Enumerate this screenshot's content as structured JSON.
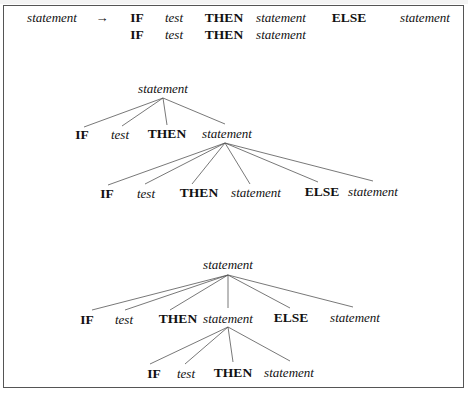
{
  "figure": {
    "grammar_rule": {
      "lhs": "statement",
      "arrow": "→",
      "alternatives": [
        [
          "IF",
          "test",
          "THEN",
          "statement",
          "ELSE",
          "statement"
        ],
        [
          "IF",
          "test",
          "THEN",
          "statement"
        ]
      ]
    },
    "parse_tree_1": {
      "root": "statement",
      "children": [
        "IF",
        "test",
        "THEN",
        "statement"
      ],
      "nested_parent": "statement",
      "nested_children": [
        "IF",
        "test",
        "THEN",
        "statement",
        "ELSE",
        "statement"
      ]
    },
    "parse_tree_2": {
      "root": "statement",
      "children": [
        "IF",
        "test",
        "THEN",
        "statement",
        "ELSE",
        "statement"
      ],
      "nested_parent": "statement",
      "nested_children": [
        "IF",
        "test",
        "THEN",
        "statement"
      ]
    }
  }
}
